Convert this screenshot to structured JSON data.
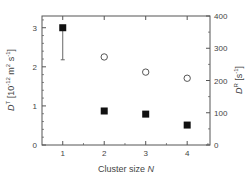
{
  "chart_data": {
    "type": "scatter",
    "title": "",
    "xlabel": "Cluster size N",
    "xlabel_main": "Cluster size ",
    "xlabel_var": "N",
    "ylabel_left": "D^T [10^-12 m^2 s^-1]",
    "ylabel_right": "D^R [s^-1]",
    "xlim": [
      0.5,
      4.55
    ],
    "ylim_left": [
      0,
      3.3
    ],
    "ylim_right": [
      0,
      400
    ],
    "x_ticks": [
      1,
      2,
      3,
      4
    ],
    "y_ticks_left": [
      0,
      1,
      2,
      3
    ],
    "y_ticks_right": [
      0,
      100,
      200,
      300,
      400
    ],
    "grid": false,
    "legend": null,
    "series": [
      {
        "name": "D^T (translational diffusion)",
        "axis": "left",
        "marker": "filled-square",
        "x": [
          1,
          2,
          3,
          4
        ],
        "values": [
          3.0,
          0.87,
          0.79,
          0.51
        ],
        "error_bars": [
          {
            "x": 1,
            "low": 2.18,
            "high": 3.0
          }
        ]
      },
      {
        "name": "D^R (rotational diffusion)",
        "axis": "right",
        "marker": "open-circle",
        "x": [
          2,
          3,
          4
        ],
        "values": [
          273,
          226,
          207
        ]
      }
    ]
  },
  "axis": {
    "left_label": {
      "D": "D",
      "sup": "T",
      "unit_open": " [10",
      "exp": "-12",
      "m": " m",
      "m_exp": "2",
      "s": " s",
      "s_exp": "-1",
      "close": "]"
    },
    "right_label": {
      "D": "D",
      "sup": "R",
      "unit": " [s",
      "exp": "-1",
      "close": "]"
    },
    "x_ticks": [
      "1",
      "2",
      "3",
      "4"
    ],
    "y_left_ticks": [
      "0",
      "1",
      "2",
      "3"
    ],
    "y_right_ticks": [
      "0",
      "100",
      "200",
      "300",
      "400"
    ]
  },
  "colors": {
    "axis": "#555555",
    "marker": "#111111",
    "text": "#444444"
  }
}
